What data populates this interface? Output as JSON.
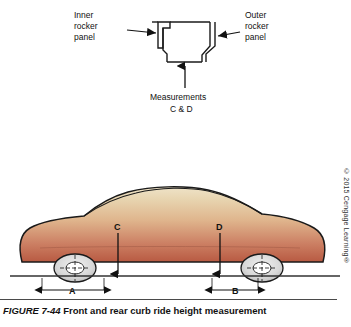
{
  "figure": {
    "caption_number": "FIGURE 7-44",
    "caption_text": "Front and rear curb ride height measurement",
    "copyright": "© 2015 Cengage Learning®"
  },
  "top_diagram": {
    "labels": {
      "inner_rocker_panel": "Inner\nrocker\npanel",
      "inner_rocker_line1": "Inner",
      "inner_rocker_line2": "rocker",
      "inner_rocker_line3": "panel",
      "outer_rocker_line1": "Outer",
      "outer_rocker_line2": "rocker",
      "outer_rocker_line3": "panel",
      "measurements_line1": "Measurements",
      "measurements_line2": "C & D"
    }
  },
  "bottom_diagram": {
    "dimension_labels": {
      "front_vertical": "C",
      "rear_vertical": "D",
      "front_horizontal": "A",
      "rear_horizontal": "B"
    }
  },
  "colors": {
    "body_gradient_top": "#e8d9b8",
    "body_gradient_bottom": "#c06a50",
    "outline": "#1a1a1a",
    "tire": "#dcdcdc",
    "ground": "#333333"
  }
}
